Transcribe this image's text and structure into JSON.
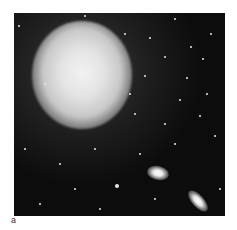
{
  "figure": {
    "panel_label": "a",
    "colors": {
      "background": "#0c0c0c",
      "glow": "#e4e4e4",
      "stars": "#e8e8e8",
      "page": "#ffffff"
    }
  }
}
